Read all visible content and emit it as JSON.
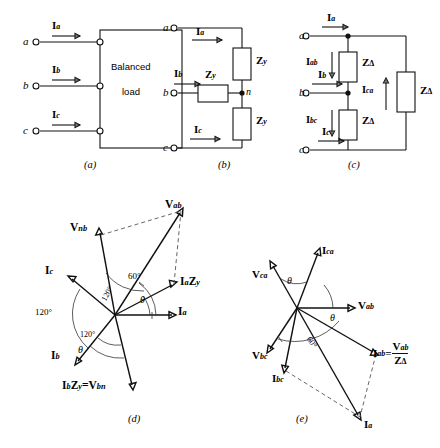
{
  "figure": {
    "panels": [
      {
        "id": "a",
        "caption": "(a)",
        "type": "balanced-load-block",
        "box_label_line1": "Balanced",
        "box_label_line2": "load",
        "terminals": [
          "a",
          "b",
          "c"
        ],
        "currents": [
          "I",
          "I",
          "I"
        ],
        "current_subs": [
          "a",
          "b",
          "c"
        ]
      },
      {
        "id": "b",
        "caption": "(b)",
        "type": "wye-connected-load",
        "terminals": [
          "a",
          "b",
          "c"
        ],
        "neutral_label": "n",
        "currents": [
          "I",
          "I",
          "I"
        ],
        "current_subs": [
          "a",
          "b",
          "c"
        ],
        "impedance": "Z",
        "impedance_sub": "y",
        "impedance_count": 3
      },
      {
        "id": "c",
        "caption": "(c)",
        "type": "delta-connected-load",
        "terminals": [
          "a",
          "b",
          "c"
        ],
        "line_currents": [
          "I",
          "I",
          "I"
        ],
        "line_current_subs": [
          "a",
          "b",
          "c"
        ],
        "phase_currents": [
          "I",
          "I",
          "I"
        ],
        "phase_current_subs": [
          "ab",
          "bc",
          "ca"
        ],
        "impedance": "Z",
        "impedance_sub": "Δ",
        "impedance_count": 3
      },
      {
        "id": "d",
        "caption": "(d)",
        "type": "phasor-diagram-wye",
        "phasors": [
          {
            "label": "I",
            "sub": "a"
          },
          {
            "label": "I",
            "sub": "b"
          },
          {
            "label": "I",
            "sub": "c"
          },
          {
            "label": "V",
            "sub": "ab"
          },
          {
            "label": "V",
            "sub": "nb"
          }
        ],
        "product_labels": [
          {
            "text": "I",
            "sub1": "a",
            "text2": "Z",
            "sub2": "y"
          },
          {
            "text": "I",
            "sub1": "b",
            "text2": "Z",
            "sub2": "y",
            "equals": "=",
            "text3": "V",
            "sub3": "bn"
          }
        ],
        "angles": [
          "120°",
          "120°",
          "120°",
          "60°",
          "θ",
          "θ"
        ]
      },
      {
        "id": "e",
        "caption": "(e)",
        "type": "phasor-diagram-delta",
        "phasors": [
          {
            "label": "V",
            "sub": "ab"
          },
          {
            "label": "V",
            "sub": "bc"
          },
          {
            "label": "V",
            "sub": "ca"
          },
          {
            "label": "I",
            "sub": "ca"
          },
          {
            "label": "I",
            "sub": "bc"
          },
          {
            "label": "I",
            "sub": "a"
          }
        ],
        "ratio_label": {
          "num_text": "V",
          "num_sub": "ab",
          "den_text": "Z",
          "den_sub": "Δ",
          "lhs_text": "I",
          "lhs_sub": "ab",
          "equals": "="
        },
        "angles": [
          "θ",
          "θ",
          "60°"
        ]
      }
    ]
  },
  "colors": {
    "stroke": "#111111",
    "dashed": "#555555",
    "background": "#ffffff"
  }
}
